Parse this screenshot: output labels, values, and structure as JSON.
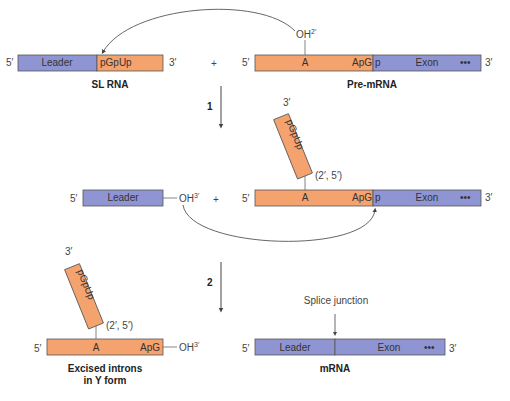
{
  "colors": {
    "leader_exon": "#8f95d3",
    "intron": "#f4a26e",
    "stroke": "#555555",
    "arrow": "#444444"
  },
  "labels": {
    "five_prime": "5′",
    "three_prime": "3′",
    "plus": "+",
    "oh": "OH",
    "sup_2prime": "2′",
    "sup_3prime": "3′",
    "leader": "Leader",
    "exon": "Exon",
    "dots": "•••",
    "pgpup": "pGpUp",
    "a": "A",
    "apg": "ApG",
    "p": "p",
    "linkage": "(2′, 5′)",
    "splice_junction": "Splice junction"
  },
  "captions": {
    "sl_rna": "SL RNA",
    "pre_mrna": "Pre-mRNA",
    "excised_line1": "Excised introns",
    "excised_line2": "in Y form",
    "mrna": "mRNA"
  },
  "steps": {
    "step1": "1",
    "step2": "2"
  }
}
